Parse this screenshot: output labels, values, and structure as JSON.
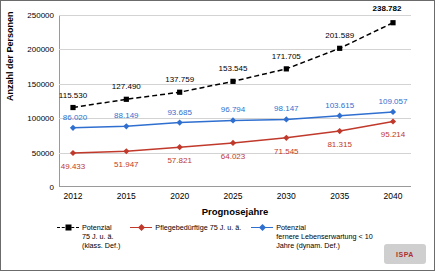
{
  "chart_data": {
    "type": "line",
    "title": "",
    "xlabel": "Prognosejahre",
    "ylabel": "Anzahl der Personen",
    "categories": [
      "2012",
      "2015",
      "2020",
      "2025",
      "2030",
      "2035",
      "2040"
    ],
    "ylim": [
      0,
      250000
    ],
    "yticks": [
      "0",
      "50000",
      "100000",
      "150000",
      "200000",
      "250000"
    ],
    "grid": true,
    "legend_position": "bottom",
    "series": [
      {
        "name": "Potenzial 75 J. u. ä. (klass. Def.)",
        "color": "#000000",
        "style": "dashed",
        "marker": "square",
        "values": [
          115530,
          127490,
          137759,
          153545,
          171705,
          201589,
          238782
        ],
        "labels": [
          "115.530",
          "127.490",
          "137.759",
          "153.545",
          "171.705",
          "201.589",
          "238.782"
        ]
      },
      {
        "name": "Potenzial fernere Lebenserwartung < 10 Jahre (dynam. Def.)",
        "color": "#2f6fd0",
        "style": "solid",
        "marker": "diamond",
        "values": [
          86020,
          88149,
          93685,
          96794,
          98147,
          103615,
          109057
        ],
        "labels": [
          "86.020",
          "88.149",
          "93.685",
          "96.794",
          "98.147",
          "103.615",
          "109.057"
        ]
      },
      {
        "name": "Pflegebedürftige 75 J. u. ä.",
        "color": "#c0392b",
        "style": "solid",
        "marker": "diamond",
        "values": [
          49433,
          51947,
          57821,
          64023,
          71545,
          81315,
          95214
        ],
        "labels": [
          "49.433",
          "51.947",
          "57.821",
          "64.023",
          "71.545",
          "81.315",
          "95.214"
        ]
      }
    ]
  },
  "legend": [
    {
      "line1": "Potenzial",
      "line2": "75 J. u. ä.",
      "line3": "(klass. Def.)"
    },
    {
      "line1": "Pflegebedürftige 75 J. u. ä.",
      "line2": "",
      "line3": ""
    },
    {
      "line1": "Potenzial",
      "line2": "fernere Lebenserwartung < 10",
      "line3": "Jahre (dynam. Def.)"
    }
  ],
  "logo": {
    "text": "ISPA"
  }
}
